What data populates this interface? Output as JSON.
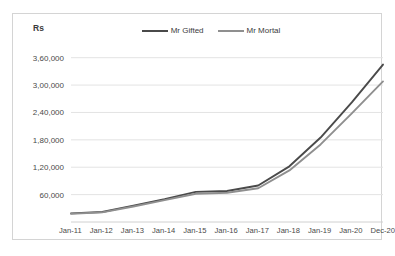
{
  "chart_data": {
    "type": "line",
    "title": "",
    "xlabel": "",
    "ylabel": "Rs",
    "ylim": [
      0,
      390000
    ],
    "yticks": [
      60000,
      120000,
      180000,
      240000,
      300000,
      360000
    ],
    "ytick_labels": [
      "60,000",
      "1,20,000",
      "1,80,000",
      "2,40,000",
      "3,00,000",
      "3,60,000"
    ],
    "grid": true,
    "legend_position": "top-center",
    "categories": [
      "Jan-11",
      "Jan-12",
      "Jan-13",
      "Jan-14",
      "Jan-15",
      "Jan-16",
      "Jan-17",
      "Jan-18",
      "Jan-19",
      "Jan-20",
      "Dec-20"
    ],
    "series": [
      {
        "name": "Mr Gifted",
        "color": "#4a4a4a",
        "values": [
          19000,
          22000,
          36000,
          50000,
          66000,
          68000,
          80000,
          122000,
          185000,
          262000,
          345000
        ]
      },
      {
        "name": "Mr Mortal",
        "color": "#8f8f8f",
        "values": [
          18000,
          21000,
          34000,
          48000,
          62000,
          64000,
          74000,
          113000,
          170000,
          238000,
          308000
        ]
      }
    ]
  },
  "axis": {
    "y_title": "Rs"
  }
}
